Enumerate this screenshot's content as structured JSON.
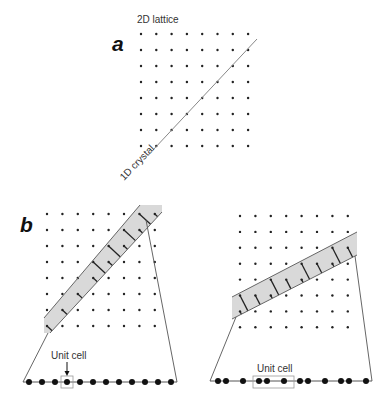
{
  "figure": {
    "panels": [
      {
        "id": "a",
        "letter": "a",
        "letter_pos": [
          112,
          51
        ],
        "lattice": {
          "x0": 141,
          "y0": 34,
          "dx": 15.3,
          "dy": 16,
          "cols": 8,
          "rows": 8
        },
        "labels": {
          "lattice": {
            "text": "2D lattice",
            "pos": [
              137,
              23
            ]
          },
          "crystal": {
            "text": "1D crystal",
            "pos": [
              124,
              181
            ],
            "rotate": -46
          }
        },
        "line": {
          "from": [
            153,
            150
          ],
          "to": [
            257,
            39
          ],
          "color": "#888888"
        }
      },
      {
        "id": "b-left",
        "letter": "b",
        "letter_pos": [
          20,
          232
        ],
        "lattice": {
          "x0": 47,
          "y0": 214,
          "dx": 15.4,
          "dy": 16,
          "cols": 8,
          "rows": 8
        },
        "band": {
          "top_edge": {
            "from": [
              44,
              318
            ],
            "to": [
              140,
              205
            ]
          },
          "bottom_edge": {
            "from": [
              50,
              333
            ],
            "to": [
              162,
              212
            ]
          },
          "polygon": [
            [
              44,
              318
            ],
            [
              140,
              205
            ],
            [
              162,
              205
            ],
            [
              162,
              212
            ],
            [
              50,
              333
            ],
            [
              44,
              333
            ]
          ],
          "fill": "#d9d9d9"
        },
        "fan": {
          "left": [
            [
              48,
              333
            ],
            [
              23,
              382
            ]
          ],
          "right": [
            [
              146,
              220
            ],
            [
              177,
              382
            ]
          ]
        },
        "chain": {
          "y": 382,
          "x_start": 23,
          "x_end": 177,
          "dots": [
            29,
            42,
            55,
            67,
            80,
            93,
            106,
            119,
            132,
            145,
            158,
            171
          ]
        },
        "unit_cell": {
          "text": "Unit cell",
          "text_pos": [
            51,
            359
          ],
          "arrow_x": 67,
          "arrow_from": 362,
          "arrow_to": 376,
          "box": [
            61,
            376,
            12,
            12
          ]
        }
      },
      {
        "id": "b-right",
        "lattice": {
          "x0": 240,
          "y0": 216,
          "dx": 15.4,
          "dy": 15.9,
          "cols": 8,
          "rows": 8
        },
        "band": {
          "top_edge": {
            "from": [
              232,
              297
            ],
            "to": [
              357,
              232
            ]
          },
          "bottom_edge": {
            "from": [
              232,
              319
            ],
            "to": [
              357,
              255
            ]
          },
          "polygon": [
            [
              232,
              297
            ],
            [
              357,
              232
            ],
            [
              357,
              255
            ],
            [
              232,
              319
            ]
          ],
          "fill": "#d9d9d9"
        },
        "fan": {
          "left": [
            [
              236,
              317
            ],
            [
              210,
              381
            ]
          ],
          "right": [
            [
              355,
              256
            ],
            [
              372,
              381
            ]
          ]
        },
        "chain": {
          "y": 381,
          "x_start": 210,
          "x_end": 372,
          "dots": [
            218,
            226,
            243,
            259,
            267,
            284,
            300,
            308,
            325,
            341,
            349,
            366
          ]
        },
        "unit_cell": {
          "text": "Unit cell",
          "text_pos": [
            257,
            372
          ],
          "box": [
            253,
            376,
            41,
            12
          ]
        }
      }
    ],
    "colors": {
      "dot": "#222222",
      "line": "#555555",
      "projection": "#222222",
      "band_edge": "#666666",
      "box": "#999999"
    }
  }
}
